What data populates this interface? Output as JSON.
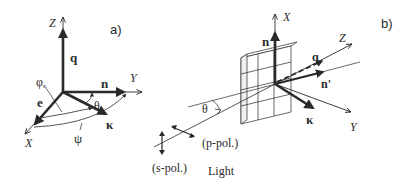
{
  "panels": [
    {
      "id": "a",
      "label": "a)",
      "axes": {
        "z": "Z",
        "y": "Y",
        "x": "X"
      },
      "vectors": {
        "q": "q",
        "n": "n",
        "e": "e",
        "kappa": "κ"
      },
      "angles": {
        "phi_kappa": "φ",
        "phi_sub": "κ",
        "theta": "θ",
        "psi": "ψ"
      }
    },
    {
      "id": "b",
      "label": "b)",
      "axes": {
        "x": "X",
        "z": "Z",
        "y": "Y"
      },
      "vectors": {
        "n": "n",
        "q": "q",
        "n_prime": "n'",
        "kappa": "κ"
      },
      "angles": {
        "theta": "θ"
      },
      "polarizations": {
        "p": "(p-pol.)",
        "s": "(s-pol.)"
      },
      "beam_label": "Light"
    }
  ],
  "colors": {
    "ink": "#2a2a2a",
    "background": "#ffffff"
  }
}
